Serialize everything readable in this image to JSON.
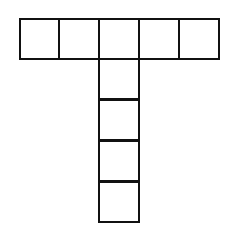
{
  "diagram": {
    "type": "T-shaped grid net",
    "cell_size": 41,
    "stroke_color": "#111111",
    "background": "#ffffff",
    "top_row": [
      {
        "x": 19,
        "y": 18
      },
      {
        "x": 58,
        "y": 18
      },
      {
        "x": 98,
        "y": 18
      },
      {
        "x": 138,
        "y": 18
      },
      {
        "x": 178,
        "y": 18
      }
    ],
    "stem": [
      {
        "x": 98,
        "y": 58
      },
      {
        "x": 98,
        "y": 99
      },
      {
        "x": 98,
        "y": 140
      },
      {
        "x": 98,
        "y": 181
      }
    ]
  }
}
